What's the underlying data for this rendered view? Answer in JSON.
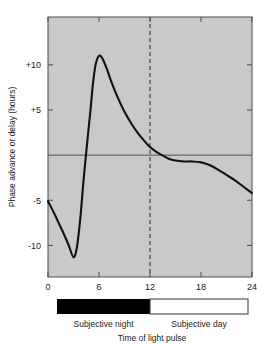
{
  "chart_data": {
    "type": "line",
    "title": "",
    "xlabel": "Time of light pulse",
    "ylabel": "Phase advance or delay (hours)",
    "xlim": [
      0,
      24
    ],
    "ylim": [
      -13.5,
      15.3
    ],
    "grid": false,
    "legend": "none",
    "x_ticks": [
      0,
      6,
      12,
      18,
      24
    ],
    "x_tick_labels": [
      "0",
      "6",
      "12",
      "18",
      "24"
    ],
    "y_ticks": [
      10,
      5,
      -5,
      -10
    ],
    "y_tick_labels": [
      "+10",
      "+5",
      "-5",
      "-10"
    ],
    "zero_line": 0,
    "annotations": [
      {
        "name": "midpoint-marker",
        "type": "vline",
        "x": 12,
        "style": "dashed"
      }
    ],
    "bands": [
      {
        "label": "Subjective night",
        "start": 0,
        "end": 12,
        "color": "#000000"
      },
      {
        "label": "Subjective day",
        "start": 12,
        "end": 24,
        "color": "#ffffff"
      }
    ],
    "series": [
      {
        "name": "Phase response curve",
        "color": "#111111",
        "points": [
          [
            0.0,
            -5.1
          ],
          [
            0.6,
            -6.2
          ],
          [
            1.2,
            -7.4
          ],
          [
            1.8,
            -8.6
          ],
          [
            2.4,
            -9.9
          ],
          [
            3.0,
            -11.3
          ],
          [
            3.4,
            -10.2
          ],
          [
            3.8,
            -7.0
          ],
          [
            4.2,
            -2.6
          ],
          [
            4.6,
            1.3
          ],
          [
            5.0,
            5.0
          ],
          [
            5.3,
            8.0
          ],
          [
            5.6,
            10.0
          ],
          [
            6.0,
            11.0
          ],
          [
            6.4,
            10.7
          ],
          [
            6.9,
            9.6
          ],
          [
            7.5,
            8.0
          ],
          [
            8.2,
            6.4
          ],
          [
            9.0,
            4.8
          ],
          [
            9.8,
            3.5
          ],
          [
            10.6,
            2.4
          ],
          [
            11.4,
            1.5
          ],
          [
            12.0,
            0.9
          ],
          [
            12.7,
            0.4
          ],
          [
            13.4,
            0.0
          ],
          [
            14.2,
            -0.4
          ],
          [
            15.0,
            -0.6
          ],
          [
            16.0,
            -0.7
          ],
          [
            17.0,
            -0.7
          ],
          [
            18.0,
            -0.8
          ],
          [
            19.0,
            -1.1
          ],
          [
            20.0,
            -1.6
          ],
          [
            21.0,
            -2.2
          ],
          [
            22.0,
            -2.8
          ],
          [
            23.0,
            -3.5
          ],
          [
            24.0,
            -4.2
          ]
        ]
      }
    ]
  },
  "style": {
    "plot_background": "#c9c9c9",
    "axis_color": "#4d4d4d",
    "curve_color": "#111111",
    "dashed_line_color": "#555555",
    "night_color": "#000000",
    "day_color": "#ffffff"
  }
}
